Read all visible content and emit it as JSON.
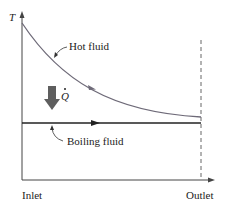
{
  "diagram": {
    "y_axis_label": "T",
    "x_axis_start_label": "Inlet",
    "x_axis_end_label": "Outlet",
    "hot_fluid_label": "Hot fluid",
    "boiling_fluid_label": "Boiling fluid",
    "heat_transfer_label": "Q",
    "colors": {
      "hot_fluid_curve": "#6e6a78",
      "boiling_fluid_line": "#222222",
      "heat_arrow": "#5e5e5e",
      "axis": "#444444",
      "dashed_outlet_line": "#666666",
      "text": "#222222"
    }
  }
}
